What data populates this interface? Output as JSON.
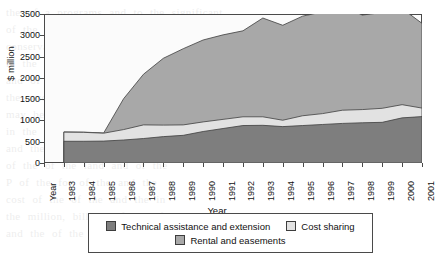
{
  "chart_data": {
    "type": "area",
    "stacked": true,
    "title": "",
    "xlabel": "Year",
    "ylabel": "$ million",
    "ylim": [
      0,
      3500
    ],
    "ytick_step": 500,
    "ytick_labels": [
      "3500",
      "3000",
      "2500",
      "2000",
      "1500",
      "1000",
      "500",
      "0"
    ],
    "grid": false,
    "legend_position": "bottom",
    "first_xtick_label": "Year",
    "categories": [
      "1983",
      "1984",
      "1985",
      "1986",
      "1987",
      "1988",
      "1989",
      "1990",
      "1991",
      "1992",
      "1993",
      "1994",
      "1995",
      "1996",
      "1997",
      "1998",
      "1999",
      "2000",
      "2001"
    ],
    "series": [
      {
        "name": "Technical assistance and extension",
        "color": "#7e7e7e",
        "values": [
          510,
          510,
          515,
          540,
          575,
          620,
          650,
          740,
          810,
          880,
          885,
          855,
          880,
          905,
          930,
          945,
          955,
          1060,
          1090
        ]
      },
      {
        "name": "Cost sharing",
        "color": "#e2e2e2",
        "values": [
          215,
          210,
          185,
          245,
          320,
          270,
          245,
          225,
          215,
          205,
          200,
          150,
          230,
          255,
          310,
          310,
          330,
          310,
          200
        ]
      },
      {
        "name": "Rental and easements",
        "color": "#a8a8a8",
        "values": [
          5,
          5,
          5,
          725,
          1190,
          1570,
          1790,
          1925,
          1985,
          2020,
          2320,
          2230,
          2340,
          2390,
          2450,
          2220,
          2250,
          2260,
          1990
        ]
      }
    ],
    "stack_totals": [
      730,
      725,
      705,
      1010,
      2085,
      2460,
      2685,
      2890,
      3010,
      3105,
      3405,
      3235,
      3450,
      3550,
      3690,
      3475,
      3535,
      3630,
      3280
    ]
  },
  "axes": {
    "y_title": "$ million",
    "x_title": "Year"
  },
  "legend": {
    "items": [
      {
        "label": "Technical assistance and extension",
        "color": "#7e7e7e"
      },
      {
        "label": "Cost sharing",
        "color": "#e2e2e2"
      },
      {
        "label": "Rental and easements",
        "color": "#a8a8a8"
      }
    ]
  },
  "background_text": {
    "lines": [
      "the of a programs and to the significant",
      "of the conservation. The success of",
      "conservation programs to be considered",
      "in the of the results in the of the",
      "and of the particular for the the of",
      "the resource of the to be and the",
      "may be the of the land the and",
      "in the of the conservation of the",
      "and the of the program in the",
      "of the of the land and of the",
      "P   of the for of the and the",
      "cost   of the of the and the in",
      "the million, billion, of the of the",
      "and   the   of the and the of the"
    ]
  }
}
